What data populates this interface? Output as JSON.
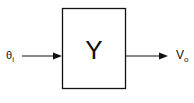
{
  "diagram": {
    "type": "block-diagram",
    "input": {
      "symbol": "θ",
      "subscript": "i"
    },
    "block": {
      "label": "Y"
    },
    "output": {
      "symbol": "V",
      "subscript": "o"
    },
    "colors": {
      "stroke": "#111111",
      "background": "#ffffff"
    }
  }
}
